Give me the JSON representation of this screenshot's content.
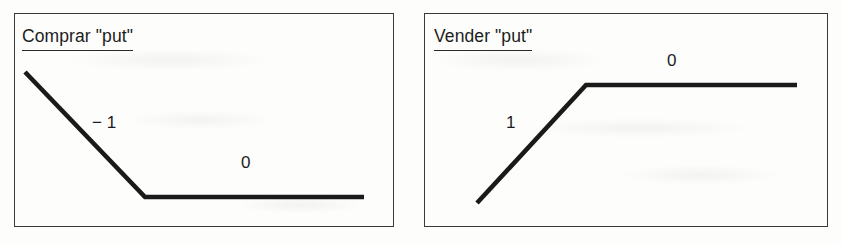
{
  "figure": {
    "kind": "option-payoff-diagram-pair",
    "panels": [
      {
        "id": "comprar-put",
        "title": "Comprar \"put\"",
        "labels": {
          "slope_left": "− 1",
          "slope_right": "0"
        }
      },
      {
        "id": "vender-put",
        "title": "Vender \"put\"",
        "labels": {
          "slope_left": "1",
          "slope_right": "0"
        }
      }
    ]
  },
  "chart_data": [
    {
      "type": "line",
      "title": "Comprar \"put\"",
      "xlabel": "",
      "ylabel": "",
      "grid": false,
      "legend": null,
      "series": [
        {
          "name": "Payoff comprar put",
          "points": [
            [
              25,
              72
            ],
            [
              145,
              197
            ],
            [
              364,
              197
            ]
          ]
        }
      ],
      "annotations": [
        {
          "text": "− 1",
          "x": 98,
          "y": 124,
          "meaning": "slope of descending segment"
        },
        {
          "text": "0",
          "x": 247,
          "y": 164,
          "meaning": "slope of flat segment"
        }
      ],
      "xlim": [
        14,
        394
      ],
      "ylim": [
        227,
        13
      ]
    },
    {
      "type": "line",
      "title": "Vender \"put\"",
      "xlabel": "",
      "ylabel": "",
      "grid": false,
      "legend": null,
      "series": [
        {
          "name": "Payoff vender put",
          "points": [
            [
              477,
              203
            ],
            [
              586,
              85
            ],
            [
              797,
              85
            ]
          ]
        }
      ],
      "annotations": [
        {
          "text": "1",
          "x": 512,
          "y": 124,
          "meaning": "slope of ascending segment"
        },
        {
          "text": "0",
          "x": 673,
          "y": 62,
          "meaning": "slope of flat segment"
        }
      ],
      "xlim": [
        424,
        828
      ],
      "ylim": [
        227,
        13
      ]
    }
  ],
  "colors": {
    "line": "#1a1a1a",
    "border": "#3a3a3a",
    "text": "#1c1c1c",
    "background": "#fdfdfc"
  }
}
